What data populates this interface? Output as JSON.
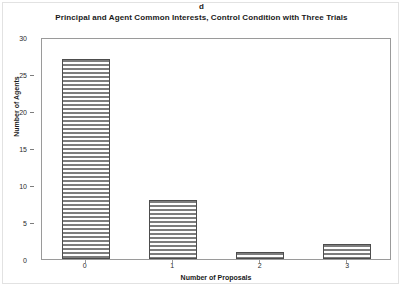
{
  "panel": {
    "label": "d"
  },
  "chart_data": {
    "type": "bar",
    "title": "Principal and Agent Common Interests, Control Condition with Three Trials",
    "categories": [
      "0",
      "1",
      "2",
      "3"
    ],
    "values": [
      27,
      8,
      1,
      2
    ],
    "xlabel": "Number of Proposals",
    "ylabel": "Number of Agents",
    "ylim": [
      0,
      30
    ],
    "yticks": [
      0,
      5,
      10,
      15,
      20,
      25,
      30
    ],
    "ytick_labels": [
      "0",
      "5",
      "10",
      "15",
      "20",
      "25",
      "30"
    ],
    "grid": false,
    "legend": "none",
    "bar_fill": "#ffffff",
    "bar_hatch": "horizontal-lines",
    "bar_edge_color": "#4d4d4d",
    "axis_color": "#9a9a9a"
  }
}
